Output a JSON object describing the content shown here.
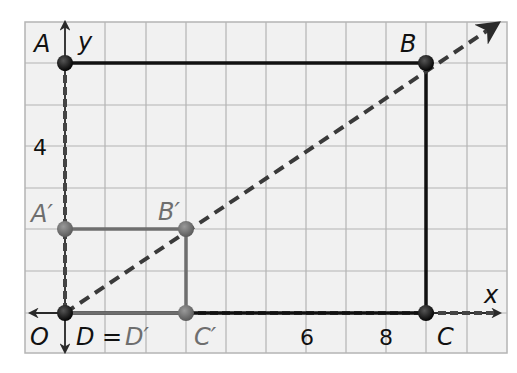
{
  "diagram": {
    "type": "coordinate-grid dilation",
    "axes": {
      "x_label": "x",
      "y_label": "y",
      "origin_label": "O"
    },
    "tick_labels": {
      "x": [
        "6",
        "8"
      ],
      "y": [
        "4"
      ]
    },
    "large_rectangle": {
      "points": [
        {
          "name": "A",
          "label": "A",
          "x": 0,
          "y": 6
        },
        {
          "name": "B",
          "label": "B",
          "x": 9,
          "y": 6
        },
        {
          "name": "C",
          "label": "C",
          "x": 9,
          "y": 0
        },
        {
          "name": "D",
          "label": "D",
          "x": 0,
          "y": 0
        }
      ],
      "color": "#111111"
    },
    "small_rectangle": {
      "points": [
        {
          "name": "A'",
          "label": "A′",
          "x": 0,
          "y": 2
        },
        {
          "name": "B'",
          "label": "B′",
          "x": 3,
          "y": 2
        },
        {
          "name": "C'",
          "label": "C′",
          "x": 3,
          "y": 0
        },
        {
          "name": "D'",
          "label": "D′",
          "x": 0,
          "y": 0
        }
      ],
      "color": "#6e6e6e"
    },
    "origin_equation": {
      "left": "D",
      "eq": "=",
      "right": "D′"
    },
    "colors": {
      "grid_fill": "#f1f1f1",
      "grid_line": "#b4b4b4",
      "dashed_ray": "#3a3a3a",
      "image_points": "#6e6e6e",
      "preimage_points": "#111111"
    }
  }
}
